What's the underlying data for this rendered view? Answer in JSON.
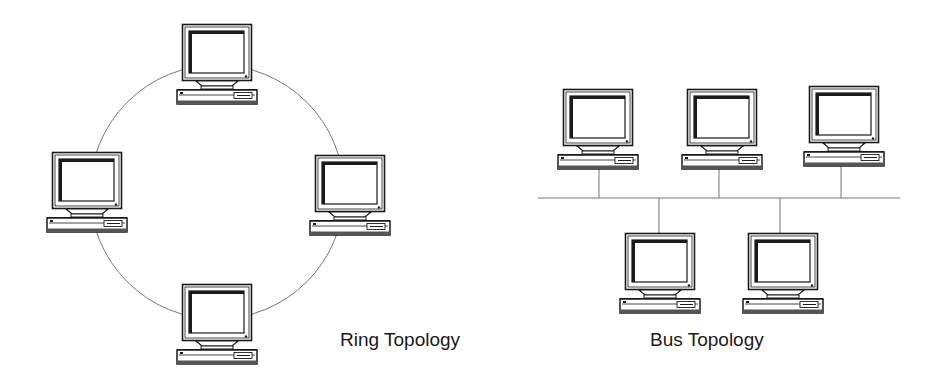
{
  "colors": {
    "background": "#ffffff",
    "line": "#777777",
    "ink": "#1a1a1a"
  },
  "ring": {
    "label": "Ring Topology",
    "circle": {
      "cx": 217,
      "cy": 192,
      "r": 127
    },
    "nodes": [
      {
        "id": "ring-top",
        "x": 182,
        "y": 24
      },
      {
        "id": "ring-left",
        "x": 52,
        "y": 152
      },
      {
        "id": "ring-right",
        "x": 315,
        "y": 155
      },
      {
        "id": "ring-bottom",
        "x": 182,
        "y": 284
      }
    ]
  },
  "bus": {
    "label": "Bus Topology",
    "backbone": {
      "x1": 538,
      "x2": 900,
      "y": 198
    },
    "nodes": [
      {
        "id": "bus-top-1",
        "x": 563,
        "y": 89,
        "side": "above",
        "drop_x": 599
      },
      {
        "id": "bus-top-2",
        "x": 687,
        "y": 89,
        "side": "above",
        "drop_x": 719
      },
      {
        "id": "bus-top-3",
        "x": 809,
        "y": 86,
        "side": "above",
        "drop_x": 841
      },
      {
        "id": "bus-bottom-1",
        "x": 625,
        "y": 233,
        "side": "below",
        "drop_x": 659
      },
      {
        "id": "bus-bottom-2",
        "x": 748,
        "y": 233,
        "side": "below",
        "drop_x": 780
      }
    ]
  },
  "icons": {
    "node": "desktop-computer-icon"
  }
}
